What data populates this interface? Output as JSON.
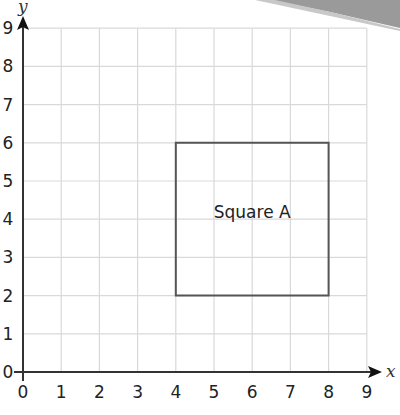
{
  "chart_data": {
    "type": "scatter",
    "title": "",
    "xlabel": "x",
    "ylabel": "y",
    "xlim": [
      0,
      9
    ],
    "ylim": [
      0,
      9
    ],
    "grid": true,
    "x_ticks": [
      "0",
      "1",
      "2",
      "3",
      "4",
      "5",
      "6",
      "7",
      "8",
      "9"
    ],
    "y_ticks": [
      "0",
      "1",
      "2",
      "3",
      "4",
      "5",
      "6",
      "7",
      "8",
      "9"
    ],
    "shapes": [
      {
        "name": "Square A",
        "label": "Square A",
        "type": "square",
        "vertices": [
          [
            4,
            2
          ],
          [
            8,
            2
          ],
          [
            8,
            6
          ],
          [
            4,
            6
          ]
        ],
        "label_position": [
          6,
          4.2
        ]
      }
    ],
    "legend": null
  },
  "colors": {
    "grid": "#d9d9d9",
    "axis": "#333333",
    "shape_stroke": "#555555",
    "corner_shade": "#8c8c8c"
  }
}
